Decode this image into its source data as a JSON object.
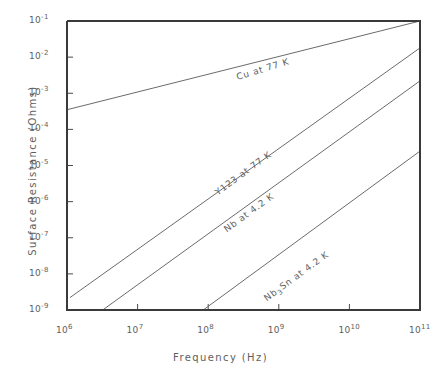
{
  "chart_data": {
    "type": "line",
    "title": "",
    "xlabel": "Frequency  (Hz)",
    "ylabel": "Surface Resistance  (Ohms)",
    "xscale": "log",
    "yscale": "log",
    "xlim": [
      1000000.0,
      100000000000.0
    ],
    "ylim": [
      1e-09,
      0.1
    ],
    "grid": false,
    "legend_position": "inline-labels",
    "xticks": [
      {
        "value": 1000000.0,
        "label": "10",
        "exp": "6"
      },
      {
        "value": 10000000.0,
        "label": "10",
        "exp": "7"
      },
      {
        "value": 100000000.0,
        "label": "10",
        "exp": "8"
      },
      {
        "value": 1000000000.0,
        "label": "10",
        "exp": "9"
      },
      {
        "value": 10000000000.0,
        "label": "10",
        "exp": "10"
      },
      {
        "value": 100000000000.0,
        "label": "10",
        "exp": "11"
      }
    ],
    "yticks": [
      {
        "value": 0.1,
        "label": "10",
        "exp": "-1"
      },
      {
        "value": 0.01,
        "label": "10",
        "exp": "-2"
      },
      {
        "value": 0.001,
        "label": "10",
        "exp": "-3"
      },
      {
        "value": 0.0001,
        "label": "10",
        "exp": "-4"
      },
      {
        "value": 1e-05,
        "label": "10",
        "exp": "-5"
      },
      {
        "value": 1e-06,
        "label": "10",
        "exp": "-6"
      },
      {
        "value": 1e-07,
        "label": "10",
        "exp": "-7"
      },
      {
        "value": 1e-08,
        "label": "10",
        "exp": "-8"
      },
      {
        "value": 1e-09,
        "label": "10",
        "exp": "-9"
      }
    ],
    "series": [
      {
        "name": "Cu at 77 K",
        "label_text": "Cu  at  77  K",
        "label_html": "Cu  at  77  K",
        "slope_decades_per_decade": 0.5,
        "x": [
          1000000.0,
          100000000000.0
        ],
        "y": [
          0.00035,
          0.1
        ],
        "label_x": 260000000.0,
        "label_y": 0.004,
        "label_angle_deg": -17
      },
      {
        "name": "Y123 at 77 K",
        "label_text": "Y123  at  77  K",
        "label_html": "Y123  at  77  K",
        "slope_decades_per_decade": 2.0,
        "x": [
          1100000.0,
          100000000000.0
        ],
        "y": [
          2.2e-09,
          0.018
        ],
        "label_x": 140000000.0,
        "label_y": 2.6e-06,
        "label_angle_deg": -36
      },
      {
        "name": "Nb at 4.2 K",
        "label_text": "Nb  at  4.2  K",
        "label_html": "Nb  at  4.2  K",
        "slope_decades_per_decade": 2.0,
        "x": [
          3200000.0,
          100000000000.0
        ],
        "y": [
          1e-09,
          0.0022
        ],
        "label_x": 190000000.0,
        "label_y": 2.4e-07,
        "label_angle_deg": -36
      },
      {
        "name": "Nb3Sn at 4.2 K",
        "label_text": "Nb3Sn  at  4.2  K",
        "label_html": "Nb<sub>3</sub>Sn  at  4.2  K",
        "slope_decades_per_decade": 2.0,
        "x": [
          85000000.0,
          100000000000.0
        ],
        "y": [
          1e-09,
          2.5e-05
        ],
        "label_x": 700000000.0,
        "label_y": 3e-09,
        "label_angle_deg": -36
      }
    ]
  },
  "colors": {
    "axis": "#3a3a3a",
    "line": "#6b6b6b",
    "text": "#5e5e5e",
    "background": "#ffffff"
  }
}
